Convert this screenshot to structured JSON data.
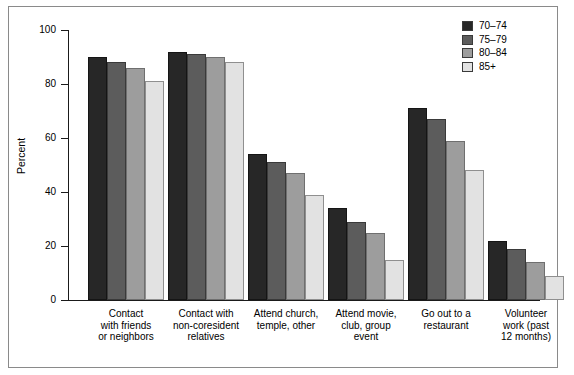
{
  "chart_data": {
    "type": "bar",
    "title": "",
    "xlabel": "",
    "ylabel": "Percent",
    "ylim": [
      0,
      100
    ],
    "yticks": [
      0,
      20,
      40,
      60,
      80,
      100
    ],
    "grid": false,
    "legend_position": "top-right",
    "categories": [
      "Contact with friends or neighbors",
      "Contact with non-coresident relatives",
      "Attend church, temple, other",
      "Attend movie, club, group event",
      "Go out to a restaurant",
      "Volunteer work (past 12 months)"
    ],
    "category_lines": [
      [
        "Contact",
        "with friends",
        "or neighbors"
      ],
      [
        "Contact with",
        "non-coresident",
        "relatives"
      ],
      [
        "Attend church,",
        "temple, other"
      ],
      [
        "Attend movie,",
        "club, group",
        "event"
      ],
      [
        "Go out to a",
        "restaurant"
      ],
      [
        "Volunteer",
        "work (past",
        "12 months)"
      ]
    ],
    "series": [
      {
        "name": "70–74",
        "color": "#272727",
        "values": [
          90,
          92,
          54,
          34,
          71,
          22
        ]
      },
      {
        "name": "75–79",
        "color": "#5c5c5c",
        "values": [
          88,
          91,
          51,
          29,
          67,
          19
        ]
      },
      {
        "name": "80–84",
        "color": "#9d9d9d",
        "values": [
          86,
          90,
          47,
          25,
          59,
          14
        ]
      },
      {
        "name": "85+",
        "color": "#e2e2e2",
        "values": [
          81,
          88,
          39,
          15,
          48,
          9
        ]
      }
    ]
  }
}
